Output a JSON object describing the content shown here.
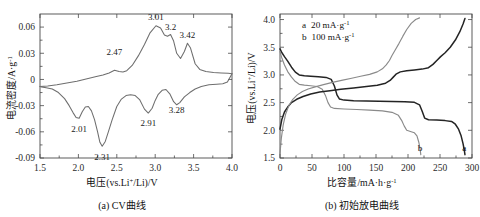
{
  "figure": {
    "panels": [
      {
        "id": "a",
        "caption": "(a) CV曲线",
        "xlabel_main": "电压(vs.Li",
        "xlabel_sup": "+",
        "xlabel_tail": "/Li)/V",
        "ylabel_main": "电流密度/A·g",
        "ylabel_sup": "-1"
      },
      {
        "id": "b",
        "caption": "(b) 初始放电曲线",
        "xlabel_main": "比容量/mA·h·g",
        "xlabel_sup": "-1",
        "ylabel_main": "电压(vs.Li",
        "ylabel_sup": "+",
        "ylabel_tail": "/Li)/V"
      }
    ]
  },
  "chart_data": [
    {
      "type": "line",
      "panel": "a",
      "title": "(a) CV曲线",
      "xlabel": "电压(vs.Li+/Li)/V",
      "ylabel": "电流密度/A·g-1",
      "xlim": [
        1.5,
        4.0
      ],
      "ylim": [
        -0.09,
        0.075
      ],
      "xticks": [
        "1.5",
        "2.0",
        "2.5",
        "3.0",
        "3.5",
        "4.0"
      ],
      "xtick_values": [
        1.5,
        2.0,
        2.5,
        3.0,
        3.5,
        4.0
      ],
      "yticks": [
        "0.06",
        "0.03",
        "0",
        "-0.03",
        "-0.06",
        "-0.09"
      ],
      "ytick_values": [
        0.06,
        0.03,
        0,
        -0.03,
        -0.06,
        -0.09
      ],
      "grid": false,
      "legend": "none",
      "annotations": [
        {
          "label": "2.47",
          "x": 2.47,
          "y": 0.022,
          "branch": "oxidation"
        },
        {
          "label": "3.01",
          "x": 3.01,
          "y": 0.062,
          "branch": "oxidation"
        },
        {
          "label": "3.2",
          "x": 3.2,
          "y": 0.051,
          "branch": "oxidation"
        },
        {
          "label": "3.42",
          "x": 3.42,
          "y": 0.042,
          "branch": "oxidation"
        },
        {
          "label": "2.01",
          "x": 2.01,
          "y": -0.045,
          "branch": "reduction"
        },
        {
          "label": "2.31",
          "x": 2.31,
          "y": -0.077,
          "branch": "reduction"
        },
        {
          "label": "2.91",
          "x": 2.91,
          "y": -0.039,
          "branch": "reduction"
        },
        {
          "label": "3.28",
          "x": 3.28,
          "y": -0.023,
          "branch": "reduction"
        }
      ],
      "series": [
        {
          "name": "oxidation (anodic sweep)",
          "points": [
            [
              1.5,
              -0.008
            ],
            [
              1.6,
              -0.0075
            ],
            [
              1.72,
              -0.006
            ],
            [
              1.85,
              -0.004
            ],
            [
              1.98,
              -0.002
            ],
            [
              2.1,
              0.0005
            ],
            [
              2.22,
              0.003
            ],
            [
              2.32,
              0.005
            ],
            [
              2.4,
              0.0075
            ],
            [
              2.47,
              0.0105
            ],
            [
              2.53,
              0.009
            ],
            [
              2.58,
              0.0085
            ],
            [
              2.63,
              0.01
            ],
            [
              2.7,
              0.016
            ],
            [
              2.78,
              0.027
            ],
            [
              2.86,
              0.04
            ],
            [
              2.93,
              0.053
            ],
            [
              3.01,
              0.0615
            ],
            [
              3.07,
              0.059
            ],
            [
              3.12,
              0.051
            ],
            [
              3.16,
              0.0495
            ],
            [
              3.2,
              0.0515
            ],
            [
              3.24,
              0.044
            ],
            [
              3.28,
              0.03
            ],
            [
              3.33,
              0.024
            ],
            [
              3.38,
              0.032
            ],
            [
              3.42,
              0.0415
            ],
            [
              3.46,
              0.036
            ],
            [
              3.52,
              0.018
            ],
            [
              3.58,
              0.0115
            ],
            [
              3.66,
              0.009
            ],
            [
              3.76,
              0.008
            ],
            [
              3.86,
              0.0075
            ],
            [
              3.95,
              0.007
            ],
            [
              4.0,
              0.0065
            ]
          ]
        },
        {
          "name": "reduction (cathodic sweep)",
          "points": [
            [
              4.0,
              0.0065
            ],
            [
              3.94,
              -0.003
            ],
            [
              3.88,
              -0.005
            ],
            [
              3.8,
              -0.0055
            ],
            [
              3.7,
              -0.006
            ],
            [
              3.6,
              -0.008
            ],
            [
              3.52,
              -0.011
            ],
            [
              3.45,
              -0.015
            ],
            [
              3.38,
              -0.02
            ],
            [
              3.32,
              -0.0265
            ],
            [
              3.28,
              -0.029
            ],
            [
              3.24,
              -0.0255
            ],
            [
              3.19,
              -0.0165
            ],
            [
              3.14,
              -0.0115
            ],
            [
              3.09,
              -0.0125
            ],
            [
              3.04,
              -0.017
            ],
            [
              3.0,
              -0.024
            ],
            [
              2.96,
              -0.033
            ],
            [
              2.91,
              -0.0385
            ],
            [
              2.86,
              -0.034
            ],
            [
              2.8,
              -0.0235
            ],
            [
              2.74,
              -0.0185
            ],
            [
              2.68,
              -0.0175
            ],
            [
              2.62,
              -0.0185
            ],
            [
              2.56,
              -0.0225
            ],
            [
              2.5,
              -0.031
            ],
            [
              2.44,
              -0.046
            ],
            [
              2.39,
              -0.06
            ],
            [
              2.35,
              -0.071
            ],
            [
              2.31,
              -0.0765
            ],
            [
              2.28,
              -0.072
            ],
            [
              2.25,
              -0.06
            ],
            [
              2.21,
              -0.046
            ],
            [
              2.17,
              -0.036
            ],
            [
              2.13,
              -0.031
            ],
            [
              2.09,
              -0.0315
            ],
            [
              2.05,
              -0.037
            ],
            [
              2.01,
              -0.0445
            ],
            [
              1.97,
              -0.0435
            ],
            [
              1.93,
              -0.038
            ],
            [
              1.88,
              -0.03
            ],
            [
              1.82,
              -0.022
            ],
            [
              1.74,
              -0.015
            ],
            [
              1.66,
              -0.011
            ],
            [
              1.58,
              -0.0095
            ],
            [
              1.52,
              -0.0085
            ],
            [
              1.5,
              -0.008
            ]
          ]
        }
      ]
    },
    {
      "type": "line",
      "panel": "b",
      "title": "(b) 初始放电曲线",
      "xlabel": "比容量/mA·h·g-1",
      "ylabel": "电压(vs.Li+/Li)/V",
      "xlim": [
        0,
        300
      ],
      "ylim": [
        1.5,
        4.1
      ],
      "xticks": [
        "0",
        "50",
        "100",
        "150",
        "200",
        "250",
        "300"
      ],
      "xtick_values": [
        0,
        50,
        100,
        150,
        200,
        250,
        300
      ],
      "yticks": [
        "4.0",
        "3.5",
        "3.0",
        "2.5",
        "2.0",
        "1.5"
      ],
      "ytick_values": [
        4.0,
        3.5,
        3.0,
        2.5,
        2.0,
        1.5
      ],
      "grid": false,
      "legend": "upper-left-inside",
      "legend_entries": [
        {
          "tag": "a",
          "label_main": "20 mA·g",
          "label_sup": "-1",
          "rate": "20 mA·g-1"
        },
        {
          "tag": "b",
          "label_main": "100 mA·g",
          "label_sup": "-1",
          "rate": "100 mA·g-1"
        }
      ],
      "curve_tags": [
        {
          "label": "b",
          "x": 219,
          "y": 1.62
        },
        {
          "label": "a",
          "x": 288,
          "y": 1.62
        }
      ],
      "series": [
        {
          "name": "discharge a (20 mA/g)",
          "tag": "a",
          "style": "dark",
          "points": [
            [
              0,
              3.47
            ],
            [
              3,
              3.4
            ],
            [
              7,
              3.33
            ],
            [
              12,
              3.25
            ],
            [
              18,
              3.14
            ],
            [
              24,
              3.05
            ],
            [
              30,
              3.0
            ],
            [
              38,
              2.985
            ],
            [
              48,
              2.975
            ],
            [
              60,
              2.965
            ],
            [
              72,
              2.955
            ],
            [
              80,
              2.92
            ],
            [
              85,
              2.8
            ],
            [
              89,
              2.64
            ],
            [
              93,
              2.565
            ],
            [
              100,
              2.545
            ],
            [
              115,
              2.535
            ],
            [
              135,
              2.53
            ],
            [
              155,
              2.525
            ],
            [
              175,
              2.52
            ],
            [
              195,
              2.515
            ],
            [
              210,
              2.505
            ],
            [
              218,
              2.46
            ],
            [
              222,
              2.35
            ],
            [
              226,
              2.22
            ],
            [
              232,
              2.19
            ],
            [
              245,
              2.185
            ],
            [
              258,
              2.175
            ],
            [
              268,
              2.16
            ],
            [
              274,
              2.11
            ],
            [
              279,
              2.02
            ],
            [
              283,
              1.9
            ],
            [
              286,
              1.76
            ],
            [
              288,
              1.64
            ],
            [
              289,
              1.56
            ]
          ]
        },
        {
          "name": "discharge b (100 mA/g)",
          "tag": "b",
          "style": "grey",
          "points": [
            [
              0,
              3.42
            ],
            [
              3,
              3.3
            ],
            [
              7,
              3.18
            ],
            [
              12,
              3.06
            ],
            [
              18,
              2.96
            ],
            [
              24,
              2.88
            ],
            [
              30,
              2.83
            ],
            [
              38,
              2.815
            ],
            [
              48,
              2.805
            ],
            [
              58,
              2.79
            ],
            [
              66,
              2.74
            ],
            [
              71,
              2.63
            ],
            [
              75,
              2.5
            ],
            [
              79,
              2.42
            ],
            [
              85,
              2.395
            ],
            [
              100,
              2.385
            ],
            [
              120,
              2.375
            ],
            [
              140,
              2.365
            ],
            [
              160,
              2.35
            ],
            [
              175,
              2.325
            ],
            [
              185,
              2.27
            ],
            [
              190,
              2.18
            ],
            [
              194,
              2.08
            ],
            [
              198,
              2.0
            ],
            [
              205,
              1.975
            ],
            [
              210,
              1.955
            ],
            [
              214,
              1.9
            ],
            [
              217,
              1.78
            ],
            [
              219,
              1.65
            ],
            [
              220,
              1.56
            ]
          ]
        },
        {
          "name": "charge a (20 mA/g)",
          "tag": "a",
          "style": "dark",
          "points": [
            [
              0,
              2.02
            ],
            [
              3,
              2.2
            ],
            [
              7,
              2.33
            ],
            [
              12,
              2.42
            ],
            [
              18,
              2.5
            ],
            [
              26,
              2.56
            ],
            [
              36,
              2.61
            ],
            [
              48,
              2.655
            ],
            [
              62,
              2.69
            ],
            [
              78,
              2.715
            ],
            [
              95,
              2.74
            ],
            [
              115,
              2.765
            ],
            [
              135,
              2.79
            ],
            [
              152,
              2.815
            ],
            [
              165,
              2.85
            ],
            [
              172,
              2.9
            ],
            [
              177,
              2.96
            ],
            [
              182,
              3.02
            ],
            [
              188,
              3.055
            ],
            [
              198,
              3.075
            ],
            [
              210,
              3.09
            ],
            [
              222,
              3.105
            ],
            [
              232,
              3.13
            ],
            [
              239,
              3.19
            ],
            [
              245,
              3.26
            ],
            [
              251,
              3.33
            ],
            [
              258,
              3.4
            ],
            [
              266,
              3.5
            ],
            [
              274,
              3.63
            ],
            [
              281,
              3.78
            ],
            [
              286,
              3.92
            ],
            [
              289,
              4.02
            ]
          ]
        },
        {
          "name": "charge b (100 mA/g)",
          "tag": "b",
          "style": "grey",
          "points": [
            [
              0,
              1.58
            ],
            [
              2,
              1.85
            ],
            [
              5,
              2.1
            ],
            [
              9,
              2.3
            ],
            [
              14,
              2.45
            ],
            [
              20,
              2.56
            ],
            [
              27,
              2.64
            ],
            [
              35,
              2.7
            ],
            [
              44,
              2.745
            ],
            [
              55,
              2.785
            ],
            [
              68,
              2.825
            ],
            [
              82,
              2.865
            ],
            [
              98,
              2.905
            ],
            [
              112,
              2.94
            ],
            [
              126,
              2.975
            ],
            [
              140,
              3.01
            ],
            [
              152,
              3.055
            ],
            [
              160,
              3.11
            ],
            [
              166,
              3.18
            ],
            [
              171,
              3.26
            ],
            [
              175,
              3.35
            ],
            [
              180,
              3.45
            ],
            [
              186,
              3.57
            ],
            [
              192,
              3.7
            ],
            [
              198,
              3.82
            ],
            [
              205,
              3.93
            ],
            [
              212,
              4.0
            ],
            [
              218,
              4.03
            ]
          ]
        }
      ]
    }
  ]
}
